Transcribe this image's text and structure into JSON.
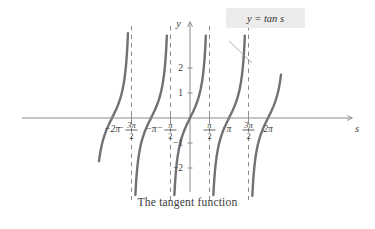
{
  "figure": {
    "caption": "The tangent function",
    "callout": {
      "text": "y = tan s",
      "box_fill": "#ececec"
    },
    "axis_labels": {
      "x": "s",
      "y": "y"
    },
    "colors": {
      "curve": "#6f7176",
      "axis": "#8c8c8c",
      "asymptote": "#8b8b8b",
      "text": "#3a3a3a",
      "leader": "#9a9a9a"
    }
  },
  "chart_data": {
    "type": "line",
    "title": "The tangent function",
    "xlabel": "s",
    "ylabel": "y",
    "xlim": [
      -7.33,
      7.33
    ],
    "ylim": [
      -3.6,
      3.6
    ],
    "grid": false,
    "legend_position": "top-right",
    "series": [
      {
        "name": "y = tan s",
        "function": "tan",
        "period": 3.14159
      }
    ],
    "x_ticks": [
      {
        "value": -6.2832,
        "label": "−2π",
        "kind": "plain"
      },
      {
        "value": -4.7124,
        "label": "-3π/2",
        "kind": "fraction",
        "numerator": "3π",
        "denominator": "2",
        "sign": "−"
      },
      {
        "value": -3.1416,
        "label": "−π",
        "kind": "plain"
      },
      {
        "value": -1.5708,
        "label": "-π/2",
        "kind": "fraction",
        "numerator": "π",
        "denominator": "2",
        "sign": "−"
      },
      {
        "value": 1.5708,
        "label": "π/2",
        "kind": "fraction",
        "numerator": "π",
        "denominator": "2",
        "sign": ""
      },
      {
        "value": 3.1416,
        "label": "π",
        "kind": "plain"
      },
      {
        "value": 4.7124,
        "label": "3π/2",
        "kind": "fraction",
        "numerator": "3π",
        "denominator": "2",
        "sign": ""
      },
      {
        "value": 6.2832,
        "label": "2π",
        "kind": "plain"
      }
    ],
    "y_ticks": [
      {
        "value": 2,
        "label": "2"
      },
      {
        "value": 1,
        "label": "1"
      },
      {
        "value": -1,
        "label": "−1"
      },
      {
        "value": -2,
        "label": "−2"
      }
    ],
    "asymptotes": [
      -4.7124,
      -1.5708,
      1.5708,
      4.7124
    ],
    "branches": [
      {
        "center": -6.2832,
        "from": -7.33,
        "to": -4.7124
      },
      {
        "center": -3.1416,
        "from": -4.7124,
        "to": -1.5708
      },
      {
        "center": 0.0,
        "from": -1.5708,
        "to": 1.5708
      },
      {
        "center": 3.1416,
        "from": 1.5708,
        "to": 4.7124
      },
      {
        "center": 6.2832,
        "from": 4.7124,
        "to": 7.33
      }
    ],
    "annotations": [
      {
        "text": "y = tan s",
        "target_x": 5.0,
        "target_y": 2.2
      }
    ]
  }
}
